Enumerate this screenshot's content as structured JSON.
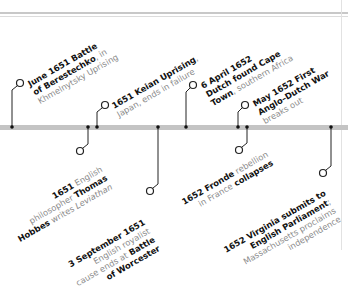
{
  "timeline": {
    "upper_events": [
      {
        "lines": [
          {
            "bold": "June 1651 Battle"
          },
          {
            "bold": "of Berestechko",
            "light": ", in"
          },
          {
            "light": "Khmelnytsky Uprising"
          }
        ]
      },
      {
        "lines": [
          {
            "bold": "1651 Keian Uprising",
            "light": ","
          },
          {
            "light": "Japan, ends in failure"
          }
        ]
      },
      {
        "lines": [
          {
            "bold": "6 April 1652"
          },
          {
            "bold": "Dutch found Cape"
          },
          {
            "bold": "Town",
            "light": ", southern Africa"
          }
        ]
      },
      {
        "lines": [
          {
            "bold": "May 1652 First"
          },
          {
            "bold": "Anglo–Dutch War"
          },
          {
            "light": "breaks out"
          }
        ]
      }
    ],
    "lower_events": [
      {
        "lines": [
          {
            "bold": "1651",
            "light": " English"
          },
          {
            "light": "philosopher ",
            "bold2": "Thomas"
          },
          {
            "bold": "Hobbes",
            "light": " writes ",
            "italic": "Leviathan"
          }
        ]
      },
      {
        "lines": [
          {
            "bold": "3 September 1651"
          },
          {
            "light": "English royalist"
          },
          {
            "light": "cause ends at ",
            "bold2": "Battle"
          },
          {
            "bold": "of Worcester"
          }
        ]
      },
      {
        "lines": [
          {
            "bold": "1652 Fronde",
            "light": " rebellion"
          },
          {
            "light": "in France ",
            "bold2": "collapses"
          }
        ]
      },
      {
        "lines": [
          {
            "bold": "1652 Virginia submits to"
          },
          {
            "bold": "English Parliament",
            "light": ";"
          },
          {
            "light": "Massachusetts proclaims"
          },
          {
            "light": "independence"
          }
        ]
      }
    ]
  },
  "colors": {
    "bar": "#c4c4c4",
    "stem": "#222222",
    "text_light": "#8a8a8a"
  }
}
